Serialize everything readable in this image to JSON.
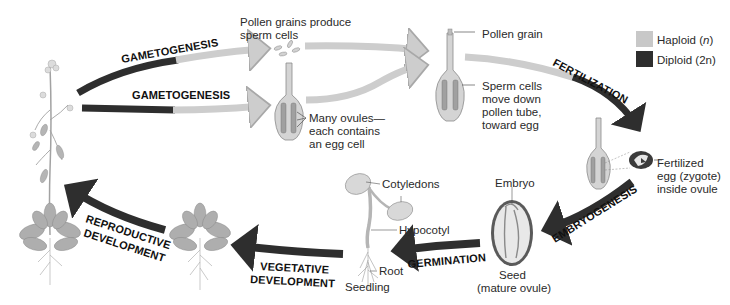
{
  "figure": {
    "type": "life-cycle diagram"
  },
  "legend": {
    "items": [
      {
        "label": "Haploid",
        "notation": "n",
        "color": "#c8c8c8"
      },
      {
        "label": "Diploid",
        "notation": "2n",
        "color": "#2e2e2e"
      }
    ]
  },
  "stages": {
    "gametogenesis_top": "GAMETOGENESIS",
    "gametogenesis_bottom": "GAMETOGENESIS",
    "fertilization": "FERTILIZATION",
    "embryogenesis": "EMBRYOGENESIS",
    "germination": "GERMINATION",
    "vegetative_line1": "VEGETATIVE",
    "vegetative_line2": "DEVELOPMENT",
    "reproductive_line1": "REPRODUCTIVE",
    "reproductive_line2": "DEVELOPMENT"
  },
  "labels": {
    "pollen_produce_line1": "Pollen grains produce",
    "pollen_produce_line2": "sperm cells",
    "ovules_line1": "Many ovules—",
    "ovules_line2": "each contains",
    "ovules_line3": "an egg cell",
    "pollen_grain": "Pollen grain",
    "sperm_line1": "Sperm cells",
    "sperm_line2": "move down",
    "sperm_line3": "pollen tube,",
    "sperm_line4": "toward egg",
    "zygote_line1": "Fertilized",
    "zygote_line2": "egg (zygote)",
    "zygote_line3": "inside ovule",
    "embryo": "Embryo",
    "seed_line1": "Seed",
    "seed_line2": "(mature ovule)",
    "cotyledons": "Cotyledons",
    "hypocotyl": "Hypocotyl",
    "root": "Root",
    "seedling": "Seedling"
  },
  "colors": {
    "haploid": "#c8c8c8",
    "diploid": "#2e2e2e",
    "plant_leaf": "#a9a9a9",
    "pistil_fill": "#d4d4d4"
  }
}
